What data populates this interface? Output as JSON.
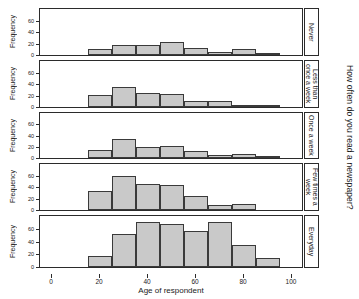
{
  "figure": {
    "outer_title": "How often do you read a newspaper?",
    "xlabel": "Age of respondent",
    "ylabel": "Frequency",
    "bar_color": "#c9c9c9",
    "bar_border_color": "#3a3a3a",
    "axis_color": "#2b2b2b"
  },
  "axes": {
    "x_ticks": [
      "0",
      "20",
      "40",
      "60",
      "80",
      "100"
    ],
    "y_ticks": [
      "0",
      "20",
      "40",
      "60"
    ]
  },
  "panels": [
    {
      "label": "Never",
      "label_lines": [
        "Never"
      ]
    },
    {
      "label": "Less than once a week",
      "label_lines": [
        "Less than",
        "once a week"
      ]
    },
    {
      "label": "Once a week",
      "label_lines": [
        "Once a week"
      ]
    },
    {
      "label": "Few times a week",
      "label_lines": [
        "Few times a",
        "week"
      ]
    },
    {
      "label": "Everyday",
      "label_lines": [
        "Everyday"
      ]
    }
  ],
  "chart_data": {
    "type": "bar",
    "title": "How often do you read a newspaper?",
    "xlabel": "Age of respondent",
    "ylabel": "Frequency",
    "xlim": [
      -5,
      105
    ],
    "ylim": [
      0,
      80
    ],
    "grid": false,
    "legend": "none",
    "layout": "trellis / lattice, 5 stacked panels, strip labels on right",
    "bin_edges": [
      15,
      25,
      35,
      45,
      55,
      65,
      75,
      85,
      95
    ],
    "bin_width": 10,
    "categories": [
      "15-25",
      "25-35",
      "35-45",
      "45-55",
      "55-65",
      "65-75",
      "75-85",
      "85-95"
    ],
    "series": [
      {
        "name": "Never",
        "values": [
          10,
          17,
          17,
          22,
          13,
          6,
          10,
          1
        ]
      },
      {
        "name": "Less than once a week",
        "values": [
          21,
          35,
          25,
          23,
          10,
          10,
          4,
          1
        ]
      },
      {
        "name": "Once a week",
        "values": [
          15,
          34,
          20,
          22,
          12,
          5,
          7,
          1
        ]
      },
      {
        "name": "Few times a week",
        "values": [
          33,
          60,
          45,
          44,
          25,
          8,
          11,
          0
        ]
      },
      {
        "name": "Everyday",
        "values": [
          18,
          52,
          70,
          67,
          57,
          70,
          35,
          14
        ]
      }
    ]
  }
}
